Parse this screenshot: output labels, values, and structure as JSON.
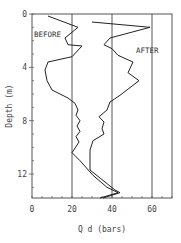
{
  "chart_data": {
    "type": "line",
    "title": "",
    "xlabel": "Q d (bars)",
    "ylabel": "Depth (m)",
    "xlim": [
      0,
      70
    ],
    "ylim": [
      13.8,
      0
    ],
    "y_inverted": true,
    "x_ticks": [
      0,
      20,
      40,
      60
    ],
    "x_tick_labels": [
      "0",
      "20",
      "40",
      "60"
    ],
    "y_ticks": [
      0,
      4,
      8,
      12
    ],
    "y_tick_labels": [
      "0",
      "4",
      "8",
      "12"
    ],
    "reference_lines_x": [
      20,
      40,
      60
    ],
    "grid": false,
    "legend": "inline annotations",
    "annotations": [
      {
        "text": "BEFORE",
        "x": 1,
        "y": 1.7
      },
      {
        "text": "AFTER",
        "x": 52,
        "y": 2.9
      }
    ],
    "series": [
      {
        "name": "BEFORE",
        "points": [
          [
            8,
            0.15
          ],
          [
            23,
            1.0
          ],
          [
            16.5,
            1.8
          ],
          [
            18,
            2.3
          ],
          [
            25,
            2.4
          ],
          [
            20,
            3.2
          ],
          [
            8,
            3.6
          ],
          [
            6.5,
            4.2
          ],
          [
            7.5,
            5.0
          ],
          [
            10,
            5.7
          ],
          [
            18,
            6.3
          ],
          [
            21.5,
            6.7
          ],
          [
            23,
            7.2
          ],
          [
            22,
            7.6
          ],
          [
            24,
            8.0
          ],
          [
            22.5,
            8.4
          ],
          [
            24,
            8.8
          ],
          [
            22,
            9.2
          ],
          [
            23.5,
            9.6
          ],
          [
            20,
            10.4
          ],
          [
            24,
            11.0
          ],
          [
            30.5,
            12.1
          ],
          [
            37.5,
            13.0
          ],
          [
            43,
            13.4
          ],
          [
            34,
            13.8
          ]
        ]
      },
      {
        "name": "AFTER",
        "points": [
          [
            30,
            0.6
          ],
          [
            59,
            1.0
          ],
          [
            39,
            1.8
          ],
          [
            36,
            2.3
          ],
          [
            40,
            2.6
          ],
          [
            43,
            3.1
          ],
          [
            50.5,
            3.6
          ],
          [
            48,
            4.4
          ],
          [
            53.5,
            5.0
          ],
          [
            44,
            6.1
          ],
          [
            39,
            6.6
          ],
          [
            37.5,
            7.2
          ],
          [
            33.5,
            7.7
          ],
          [
            36,
            8.1
          ],
          [
            35,
            8.6
          ],
          [
            36,
            9.0
          ],
          [
            30.5,
            9.5
          ],
          [
            29,
            10.2
          ],
          [
            29,
            11.7
          ],
          [
            34,
            12.3
          ],
          [
            41.5,
            13.2
          ],
          [
            44,
            13.4
          ],
          [
            35.5,
            13.8
          ]
        ]
      }
    ]
  }
}
